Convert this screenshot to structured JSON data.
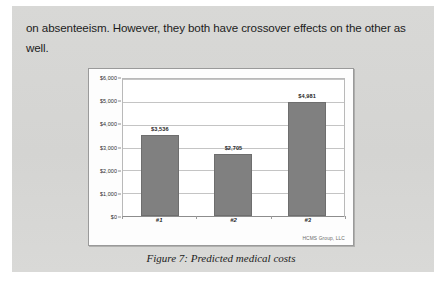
{
  "document": {
    "body_paragraph": "on absenteeism. However, they both have crossover effects on the other as well."
  },
  "figure": {
    "caption": "Figure 7: Predicted medical costs",
    "attribution": "HCMS Group, LLC"
  },
  "chart_data": {
    "type": "bar",
    "title": "",
    "xlabel": "",
    "ylabel": "",
    "categories": [
      "#1",
      "#2",
      "#3"
    ],
    "values": [
      3536,
      2705,
      4981
    ],
    "value_labels": [
      "$3,536",
      "$2,705",
      "$4,981"
    ],
    "ylim": [
      0,
      6000
    ],
    "ytick_values": [
      0,
      1000,
      2000,
      3000,
      4000,
      5000,
      6000
    ],
    "ytick_labels": [
      "$0",
      "$1,000",
      "$2,000",
      "$3,000",
      "$4,000",
      "$5,000",
      "$6,000"
    ],
    "grid": true,
    "legend": "none",
    "bar_color": "#808080",
    "plot_background": "#ffffff"
  },
  "colors": {
    "page_background": "#d6d6d4",
    "text": "#1c1c1c",
    "bar_fill": "#808080",
    "gridline": "#c4c4c4"
  }
}
